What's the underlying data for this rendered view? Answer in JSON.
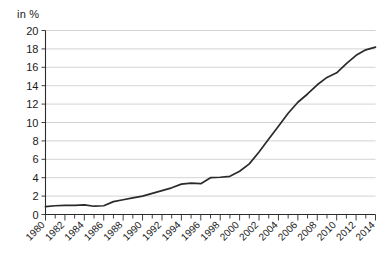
{
  "chart_data": {
    "type": "line",
    "title": "",
    "subtitle": "",
    "xlabel": "",
    "ylabel": "in %",
    "unit_label": "in %",
    "grid": true,
    "legend": false,
    "legend_position": "none",
    "xlim": [
      1980,
      2014
    ],
    "ylim": [
      0,
      20
    ],
    "y_tick_step": 2,
    "x_tick_step_minor": 1,
    "x_tick_step_major": 2,
    "ytick_labels": [
      "0",
      "2",
      "4",
      "6",
      "8",
      "10",
      "12",
      "14",
      "16",
      "18",
      "20"
    ],
    "ytick_values": [
      0,
      2,
      4,
      6,
      8,
      10,
      12,
      14,
      16,
      18,
      20
    ],
    "xtick_labels": [
      "1980",
      "1982",
      "1984",
      "1986",
      "1988",
      "1990",
      "1992",
      "1994",
      "1996",
      "1998",
      "2000",
      "2002",
      "2004",
      "2006",
      "2008",
      "2010",
      "2012",
      "2014"
    ],
    "xtick_values": [
      1980,
      1982,
      1984,
      1986,
      1988,
      1990,
      1992,
      1994,
      1996,
      1998,
      2000,
      2002,
      2004,
      2006,
      2008,
      2010,
      2012,
      2014
    ],
    "x": [
      1980,
      1981,
      1982,
      1983,
      1984,
      1985,
      1986,
      1987,
      1988,
      1989,
      1990,
      1991,
      1992,
      1993,
      1994,
      1995,
      1996,
      1997,
      1998,
      1999,
      2000,
      2001,
      2002,
      2003,
      2004,
      2005,
      2006,
      2007,
      2008,
      2009,
      2010,
      2011,
      2012,
      2013,
      2014
    ],
    "values": [
      0.85,
      0.95,
      1.0,
      1.0,
      1.05,
      0.9,
      0.95,
      1.4,
      1.6,
      1.8,
      2.0,
      2.3,
      2.6,
      2.9,
      3.3,
      3.4,
      3.35,
      4.0,
      4.05,
      4.15,
      4.7,
      5.5,
      6.8,
      8.2,
      9.6,
      11.0,
      12.2,
      13.1,
      14.1,
      14.9,
      15.4,
      16.4,
      17.3,
      17.9,
      18.2
    ],
    "series_name": "Anteil in %",
    "line_color": "#2a2a2a",
    "grid_color": "#c8c8c8",
    "axis_color": "#2b2b2b",
    "background_color": "#ffffff"
  }
}
